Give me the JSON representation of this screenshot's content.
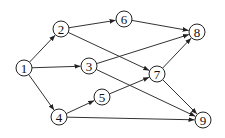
{
  "diagram": {
    "type": "directed-graph",
    "nodes": [
      {
        "id": "1",
        "label": "1",
        "x": 24,
        "y": 68
      },
      {
        "id": "2",
        "label": "2",
        "x": 61,
        "y": 29
      },
      {
        "id": "3",
        "label": "3",
        "x": 89,
        "y": 66
      },
      {
        "id": "4",
        "label": "4",
        "x": 59,
        "y": 117
      },
      {
        "id": "5",
        "label": "5",
        "x": 102,
        "y": 97
      },
      {
        "id": "6",
        "label": "6",
        "x": 124,
        "y": 19
      },
      {
        "id": "7",
        "label": "7",
        "x": 157,
        "y": 74
      },
      {
        "id": "8",
        "label": "8",
        "x": 197,
        "y": 32
      },
      {
        "id": "9",
        "label": "9",
        "x": 203,
        "y": 120
      }
    ],
    "edges": [
      {
        "from": "1",
        "to": "2"
      },
      {
        "from": "1",
        "to": "3"
      },
      {
        "from": "1",
        "to": "4"
      },
      {
        "from": "2",
        "to": "6"
      },
      {
        "from": "2",
        "to": "7"
      },
      {
        "from": "3",
        "to": "8"
      },
      {
        "from": "3",
        "to": "9"
      },
      {
        "from": "4",
        "to": "5"
      },
      {
        "from": "4",
        "to": "9"
      },
      {
        "from": "5",
        "to": "7"
      },
      {
        "from": "6",
        "to": "8"
      },
      {
        "from": "7",
        "to": "8"
      },
      {
        "from": "7",
        "to": "9"
      }
    ],
    "node_radius": 8,
    "colors": {
      "stroke": "#222222",
      "fill": "#ffffff",
      "background": "#ffffff"
    }
  }
}
